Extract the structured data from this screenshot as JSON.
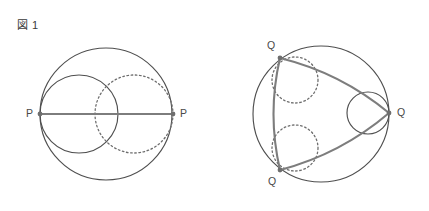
{
  "document": {
    "kind": "geometry-figure-pair",
    "background_color": "#ffffff"
  },
  "palette": {
    "outer_circle_stroke": "#4f4f4f",
    "inner_solid_stroke": "#4f4f4f",
    "inner_dotted_stroke": "#6d6d6d",
    "chord_stroke": "#7d7d7d",
    "vertex_dot": "#6e6e6e",
    "label_text": "#444444",
    "caption_text": "#3a3a3a"
  },
  "figures": [
    {
      "id": "fig1",
      "caption": "図 1",
      "outer_circle": {
        "cx": 106,
        "cy": 114,
        "r": 66,
        "style": "solid"
      },
      "inner_circles": [
        {
          "name": "left-solid-circle",
          "cx": 79,
          "cy": 114,
          "r": 39,
          "style": "solid"
        },
        {
          "name": "right-dotted-circle",
          "cx": 134,
          "cy": 114,
          "r": 39,
          "style": "dotted"
        }
      ],
      "chords": [
        {
          "name": "diameter-chord",
          "x1": 40,
          "y1": 114,
          "x2": 173,
          "y2": 114
        }
      ],
      "vertices": [
        {
          "name": "vertex-p-left",
          "label": "P",
          "x": 40,
          "y": 114,
          "label_x": 26,
          "label_y": 108
        },
        {
          "name": "vertex-p-right",
          "label": "P",
          "x": 173,
          "y": 114,
          "label_x": 180,
          "label_y": 108
        }
      ]
    },
    {
      "id": "fig2",
      "caption": "図 2",
      "outer_circle": {
        "cx": 321,
        "cy": 114,
        "r": 68,
        "style": "solid"
      },
      "inner_circles": [
        {
          "name": "right-solid-circle",
          "cx": 368,
          "cy": 113,
          "r": 21,
          "style": "solid"
        },
        {
          "name": "upper-left-dotted-circle",
          "cx": 295,
          "cy": 80,
          "r": 23,
          "style": "dotted"
        },
        {
          "name": "lower-left-dotted-circle",
          "cx": 295,
          "cy": 148,
          "r": 23,
          "style": "dotted"
        }
      ],
      "chords": [
        {
          "name": "chord-top-to-right",
          "x1": 280,
          "y1": 58,
          "x2": 389,
          "y2": 113,
          "bulge": 14
        },
        {
          "name": "chord-right-to-bottom",
          "x1": 389,
          "y1": 113,
          "x2": 280,
          "y2": 170,
          "bulge": 14
        },
        {
          "name": "chord-top-to-bottom",
          "x1": 280,
          "y1": 58,
          "x2": 280,
          "y2": 170,
          "bulge": 13
        }
      ],
      "vertices": [
        {
          "name": "vertex-q-top",
          "label": "Q",
          "x": 280,
          "y": 58,
          "label_x": 267,
          "label_y": 40
        },
        {
          "name": "vertex-q-right",
          "label": "Q",
          "x": 389,
          "y": 113,
          "label_x": 397,
          "label_y": 107
        },
        {
          "name": "vertex-q-bottom",
          "label": "Q",
          "x": 280,
          "y": 170,
          "label_x": 268,
          "label_y": 176
        }
      ]
    }
  ]
}
